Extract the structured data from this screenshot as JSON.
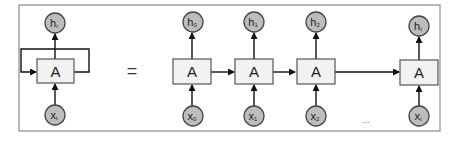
{
  "diagram": {
    "folded": {
      "cell_label": "A",
      "input": {
        "base": "x",
        "sub": "t"
      },
      "output": {
        "base": "h",
        "sub": "t"
      }
    },
    "equals_sign": "=",
    "unrolled": [
      {
        "cell_label": "A",
        "input": {
          "base": "x",
          "sub": "0"
        },
        "output": {
          "base": "h",
          "sub": "0"
        }
      },
      {
        "cell_label": "A",
        "input": {
          "base": "x",
          "sub": "1"
        },
        "output": {
          "base": "h",
          "sub": "1"
        }
      },
      {
        "cell_label": "A",
        "input": {
          "base": "x",
          "sub": "2"
        },
        "output": {
          "base": "h",
          "sub": "2"
        }
      },
      {
        "cell_label": "A",
        "input": {
          "base": "x",
          "sub": "t"
        },
        "output": {
          "base": "h",
          "sub": "t"
        }
      }
    ],
    "ellipsis": "...",
    "colors": {
      "node_fill": "#bdbdbd",
      "cell_fill": "#f2f2f2",
      "stroke": "#111111",
      "frame": "#8a8a8a"
    }
  }
}
